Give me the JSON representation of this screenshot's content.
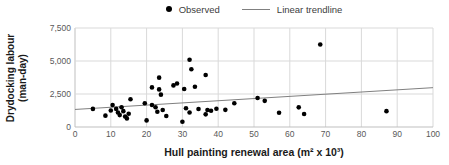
{
  "chart_data": {
    "type": "scatter",
    "title": "",
    "xlabel": "Hull painting renewal area (m² x 10³)",
    "ylabel": "Drydocking labour (man-day)",
    "xlim": [
      0,
      100
    ],
    "ylim": [
      0,
      7500
    ],
    "xticks": [
      0,
      10,
      20,
      30,
      40,
      50,
      60,
      70,
      80,
      90,
      100
    ],
    "xtick_labels": [
      "0",
      "10",
      "20",
      "30",
      "40",
      "50",
      "60",
      "70",
      "80",
      "90",
      "100"
    ],
    "yticks": [
      0,
      2500,
      5000,
      7500
    ],
    "ytick_labels": [
      "0",
      "2,500",
      "5,000",
      "7,500"
    ],
    "grid": "both",
    "legend": {
      "position": "top-center",
      "items": [
        {
          "label": "Observed",
          "marker": "dot"
        },
        {
          "label": "Linear trendline",
          "marker": "line"
        }
      ]
    },
    "series": [
      {
        "name": "Observed",
        "type": "scatter",
        "points": [
          [
            5,
            1370
          ],
          [
            8.5,
            860
          ],
          [
            10,
            1250
          ],
          [
            10.5,
            1670
          ],
          [
            11.5,
            1370
          ],
          [
            12,
            1100
          ],
          [
            12.5,
            900
          ],
          [
            13,
            1500
          ],
          [
            13.5,
            1200
          ],
          [
            14,
            800
          ],
          [
            14.5,
            650
          ],
          [
            15,
            1000
          ],
          [
            15.5,
            2100
          ],
          [
            19.5,
            1800
          ],
          [
            20,
            500
          ],
          [
            21.5,
            3000
          ],
          [
            21.5,
            1670
          ],
          [
            22.5,
            1500
          ],
          [
            23,
            1160
          ],
          [
            23.5,
            3740
          ],
          [
            23.5,
            2850
          ],
          [
            24,
            2450
          ],
          [
            24.5,
            1290
          ],
          [
            25.5,
            830
          ],
          [
            27.5,
            3150
          ],
          [
            28.5,
            3300
          ],
          [
            30,
            400
          ],
          [
            30.5,
            2880
          ],
          [
            31,
            1420
          ],
          [
            32,
            5100
          ],
          [
            32,
            1100
          ],
          [
            32.5,
            4370
          ],
          [
            33.5,
            3050
          ],
          [
            34.5,
            1360
          ],
          [
            36.5,
            3940
          ],
          [
            36.5,
            960
          ],
          [
            37,
            1290
          ],
          [
            38,
            1230
          ],
          [
            39.5,
            1380
          ],
          [
            42,
            1300
          ],
          [
            44.5,
            1800
          ],
          [
            51,
            2200
          ],
          [
            53,
            1980
          ],
          [
            57,
            1080
          ],
          [
            62.5,
            1490
          ],
          [
            64,
            990
          ],
          [
            68.5,
            6250
          ],
          [
            87,
            1200
          ]
        ]
      },
      {
        "name": "Linear trendline",
        "type": "line",
        "x": [
          0,
          100
        ],
        "y": [
          1330,
          2980
        ]
      }
    ],
    "colors": {
      "point": "#000000",
      "trendline": "#808080",
      "grid": "#d9d9d9",
      "axis": "#bfbfbf",
      "tick_text": "#595959",
      "title_text": "#1a1a1a"
    }
  }
}
